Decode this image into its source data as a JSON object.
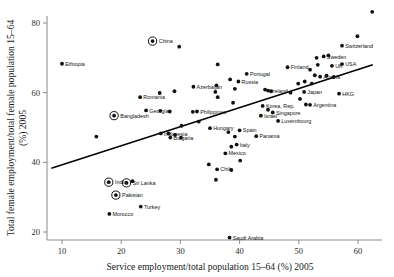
{
  "chart_data": {
    "type": "scatter",
    "title": "",
    "xlabel": "Service employment/total population 15–64 (%) 2005",
    "ylabel": "Total female employment/total female population 15–64 (%) 2005",
    "xlim": [
      7,
      64
    ],
    "ylim": [
      15,
      84
    ],
    "xticks": [
      10,
      20,
      30,
      40,
      50,
      60
    ],
    "yticks": [
      20,
      40,
      60,
      80
    ],
    "grid": false,
    "legend": null,
    "trendline": {
      "x": [
        8.2,
        62.5
      ],
      "y": [
        38.3,
        68.0
      ],
      "style": "solid",
      "color": "#000000"
    },
    "marker_note": "circled markers denote highlighted countries",
    "points": [
      {
        "label": "Ethiopia",
        "x": 10.0,
        "y": 68.3,
        "circled": false,
        "lp": "right"
      },
      {
        "label": "China",
        "x": 25.3,
        "y": 74.8,
        "circled": true,
        "lp": "right"
      },
      {
        "label": "Bangladesh",
        "x": 18.8,
        "y": 53.4,
        "circled": true,
        "lp": "right"
      },
      {
        "label": "Romania",
        "x": 23.2,
        "y": 58.7,
        "circled": false,
        "lp": "right"
      },
      {
        "label": "Georgia",
        "x": 24.2,
        "y": 54.9,
        "circled": false,
        "lp": "right"
      },
      {
        "label": "Azerbaijan",
        "x": 32.2,
        "y": 61.7,
        "circled": false,
        "lp": "right"
      },
      {
        "label": "Philippines",
        "x": 32.8,
        "y": 54.6,
        "circled": false,
        "lp": "right"
      },
      {
        "label": "Indonesia",
        "x": 26.7,
        "y": 48.3,
        "circled": false,
        "lp": "right"
      },
      {
        "label": "Bulgaria",
        "x": 28.3,
        "y": 47.1,
        "circled": false,
        "lp": "right"
      },
      {
        "label": "Hungary",
        "x": 35.0,
        "y": 49.8,
        "circled": false,
        "lp": "right"
      },
      {
        "label": "Portugal",
        "x": 41.2,
        "y": 65.4,
        "circled": false,
        "lp": "right"
      },
      {
        "label": "Russia",
        "x": 39.8,
        "y": 63.2,
        "circled": false,
        "lp": "right"
      },
      {
        "label": "Finland",
        "x": 48.1,
        "y": 67.3,
        "circled": false,
        "lp": "right"
      },
      {
        "label": "Ireland",
        "x": 44.8,
        "y": 60.6,
        "circled": false,
        "lp": "right"
      },
      {
        "label": "Korea, Rep.",
        "x": 43.9,
        "y": 56.2,
        "circled": false,
        "lp": "right"
      },
      {
        "label": "Israel",
        "x": 43.6,
        "y": 53.4,
        "circled": false,
        "lp": "right"
      },
      {
        "label": "Singapore",
        "x": 45.6,
        "y": 54.3,
        "circled": false,
        "lp": "right"
      },
      {
        "label": "Luxembourg",
        "x": 46.5,
        "y": 51.9,
        "circled": false,
        "lp": "right"
      },
      {
        "label": "Spain",
        "x": 40.0,
        "y": 49.2,
        "circled": false,
        "lp": "right"
      },
      {
        "label": "Panama",
        "x": 42.8,
        "y": 47.5,
        "circled": false,
        "lp": "right"
      },
      {
        "label": "Italy",
        "x": 39.5,
        "y": 45.1,
        "circled": false,
        "lp": "right"
      },
      {
        "label": "Mexico",
        "x": 37.6,
        "y": 42.6,
        "circled": false,
        "lp": "right"
      },
      {
        "label": "Chile",
        "x": 36.2,
        "y": 38.0,
        "circled": false,
        "lp": "right"
      },
      {
        "label": "Japan",
        "x": 50.9,
        "y": 60.2,
        "circled": false,
        "lp": "right"
      },
      {
        "label": "Austria",
        "x": 53.6,
        "y": 64.6,
        "circled": false,
        "lp": "right"
      },
      {
        "label": "Sweden",
        "x": 54.2,
        "y": 70.4,
        "circled": false,
        "lp": "right"
      },
      {
        "label": "UK",
        "x": 55.6,
        "y": 67.7,
        "circled": false,
        "lp": "right"
      },
      {
        "label": "USA",
        "x": 57.3,
        "y": 68.2,
        "circled": false,
        "lp": "right"
      },
      {
        "label": "Switzerland",
        "x": 57.3,
        "y": 73.5,
        "circled": false,
        "lp": "right"
      },
      {
        "label": "Argentina",
        "x": 51.9,
        "y": 56.5,
        "circled": false,
        "lp": "right"
      },
      {
        "label": "HKG",
        "x": 56.8,
        "y": 59.7,
        "circled": false,
        "lp": "right"
      },
      {
        "label": "India",
        "x": 17.9,
        "y": 34.3,
        "circled": true,
        "lp": "right"
      },
      {
        "label": "Sri Lanka",
        "x": 20.9,
        "y": 34.1,
        "circled": true,
        "lp": "right"
      },
      {
        "label": "Pakistan",
        "x": 19.1,
        "y": 30.6,
        "circled": true,
        "lp": "right"
      },
      {
        "label": "Turkey",
        "x": 23.3,
        "y": 27.3,
        "circled": false,
        "lp": "right"
      },
      {
        "label": "Morocco",
        "x": 18.0,
        "y": 25.2,
        "circled": false,
        "lp": "right"
      },
      {
        "label": "Saudi Arabia",
        "x": 38.3,
        "y": 18.4,
        "circled": false,
        "lp": "right"
      },
      {
        "label": "",
        "x": 62.4,
        "y": 83.2,
        "circled": false
      },
      {
        "label": "",
        "x": 29.8,
        "y": 73.2,
        "circled": false
      },
      {
        "label": "",
        "x": 59.9,
        "y": 76.2,
        "circled": false
      },
      {
        "label": "",
        "x": 36.3,
        "y": 68.1,
        "circled": false
      },
      {
        "label": "",
        "x": 55.0,
        "y": 70.7,
        "circled": false
      },
      {
        "label": "",
        "x": 53.0,
        "y": 70.0,
        "circled": false
      },
      {
        "label": "",
        "x": 53.2,
        "y": 68.0,
        "circled": false
      },
      {
        "label": "",
        "x": 51.9,
        "y": 66.6,
        "circled": false
      },
      {
        "label": "",
        "x": 52.7,
        "y": 65.0,
        "circled": false
      },
      {
        "label": "",
        "x": 54.7,
        "y": 64.9,
        "circled": false
      },
      {
        "label": "",
        "x": 55.9,
        "y": 64.5,
        "circled": false
      },
      {
        "label": "",
        "x": 51.0,
        "y": 63.2,
        "circled": false
      },
      {
        "label": "",
        "x": 49.9,
        "y": 62.6,
        "circled": false
      },
      {
        "label": "",
        "x": 52.2,
        "y": 62.6,
        "circled": false
      },
      {
        "label": "",
        "x": 36.1,
        "y": 62.1,
        "circled": false
      },
      {
        "label": "",
        "x": 38.4,
        "y": 63.8,
        "circled": false
      },
      {
        "label": "",
        "x": 39.2,
        "y": 61.1,
        "circled": false
      },
      {
        "label": "",
        "x": 35.9,
        "y": 60.2,
        "circled": false
      },
      {
        "label": "",
        "x": 29.0,
        "y": 60.4,
        "circled": false
      },
      {
        "label": "",
        "x": 26.5,
        "y": 59.9,
        "circled": false
      },
      {
        "label": "",
        "x": 36.3,
        "y": 58.7,
        "circled": false
      },
      {
        "label": "",
        "x": 38.9,
        "y": 57.1,
        "circled": false
      },
      {
        "label": "",
        "x": 44.3,
        "y": 60.9,
        "circled": false
      },
      {
        "label": "",
        "x": 45.3,
        "y": 60.4,
        "circled": false
      },
      {
        "label": "",
        "x": 48.6,
        "y": 60.0,
        "circled": false
      },
      {
        "label": "",
        "x": 50.2,
        "y": 58.2,
        "circled": false
      },
      {
        "label": "",
        "x": 51.2,
        "y": 56.6,
        "circled": false
      },
      {
        "label": "",
        "x": 44.8,
        "y": 55.1,
        "circled": false
      },
      {
        "label": "",
        "x": 28.2,
        "y": 54.6,
        "circled": false
      },
      {
        "label": "",
        "x": 26.6,
        "y": 54.8,
        "circled": false
      },
      {
        "label": "",
        "x": 32.1,
        "y": 54.5,
        "circled": false
      },
      {
        "label": "",
        "x": 33.1,
        "y": 51.7,
        "circled": false
      },
      {
        "label": "",
        "x": 30.2,
        "y": 50.5,
        "circled": false
      },
      {
        "label": "",
        "x": 28.0,
        "y": 48.3,
        "circled": false
      },
      {
        "label": "",
        "x": 29.1,
        "y": 47.9,
        "circled": false
      },
      {
        "label": "",
        "x": 30.1,
        "y": 47.1,
        "circled": false
      },
      {
        "label": "",
        "x": 15.8,
        "y": 47.4,
        "circled": false
      },
      {
        "label": "",
        "x": 38.1,
        "y": 48.7,
        "circled": false
      },
      {
        "label": "",
        "x": 39.2,
        "y": 47.4,
        "circled": false
      },
      {
        "label": "",
        "x": 38.6,
        "y": 44.5,
        "circled": false
      },
      {
        "label": "",
        "x": 40.1,
        "y": 40.5,
        "circled": false
      },
      {
        "label": "",
        "x": 38.6,
        "y": 37.8,
        "circled": false
      },
      {
        "label": "",
        "x": 34.8,
        "y": 39.4,
        "circled": false
      },
      {
        "label": "",
        "x": 36.0,
        "y": 35.0,
        "circled": false
      },
      {
        "label": "",
        "x": 21.9,
        "y": 34.6,
        "circled": false
      }
    ]
  },
  "figure": {
    "x_axis_title": "Service employment/total population 15–64 (%) 2005",
    "y_axis_title_line1": "Total female employment/total female population 15–64",
    "y_axis_title_line2": "(%) 2005"
  }
}
